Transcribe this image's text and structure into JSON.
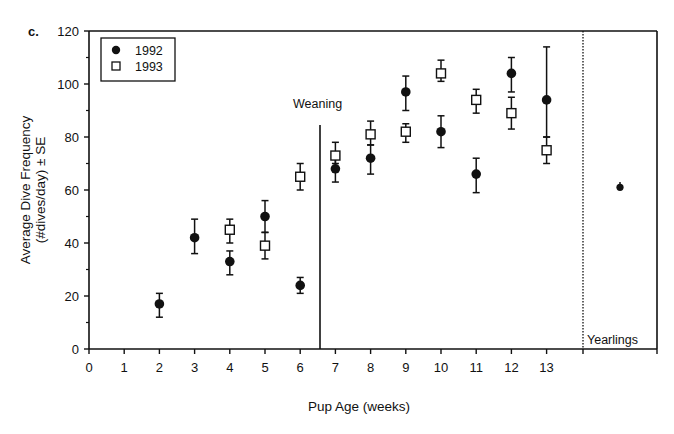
{
  "panel_label": "c.",
  "chart_data": {
    "type": "scatter",
    "title": "",
    "xlabel": "Pup Age (weeks)",
    "ylabel_line1": "Average Dive Frequency",
    "ylabel_line2": "(#dives/day) ± SE",
    "ylim": [
      0,
      120
    ],
    "xlim": [
      0,
      15
    ],
    "yticks": [
      0,
      20,
      40,
      60,
      80,
      100,
      120
    ],
    "xticks": [
      0,
      1,
      2,
      3,
      4,
      5,
      6,
      7,
      8,
      9,
      10,
      11,
      12,
      13
    ],
    "grid": false,
    "legend_position": "top-left",
    "annotations": [
      {
        "text": "Weaning",
        "x": 6.5,
        "type": "vertical-solid-line"
      },
      {
        "text": "Yearlings",
        "x": 14,
        "type": "vertical-dotted-line"
      }
    ],
    "series": [
      {
        "name": "1992",
        "marker": "filled-circle",
        "points": [
          {
            "x": 2,
            "y": 17,
            "lo": 12,
            "hi": 21
          },
          {
            "x": 3,
            "y": 42,
            "lo": 36,
            "hi": 49
          },
          {
            "x": 4,
            "y": 33,
            "lo": 28,
            "hi": 37
          },
          {
            "x": 5,
            "y": 50,
            "lo": 44,
            "hi": 56
          },
          {
            "x": 6,
            "y": 24,
            "lo": 21,
            "hi": 27
          },
          {
            "x": 7,
            "y": 68,
            "lo": 63,
            "hi": 73
          },
          {
            "x": 8,
            "y": 72,
            "lo": 66,
            "hi": 77
          },
          {
            "x": 9,
            "y": 97,
            "lo": 90,
            "hi": 103
          },
          {
            "x": 10,
            "y": 82,
            "lo": 76,
            "hi": 88
          },
          {
            "x": 11,
            "y": 66,
            "lo": 59,
            "hi": 72
          },
          {
            "x": 12,
            "y": 104,
            "lo": 97,
            "hi": 110
          },
          {
            "x": 13,
            "y": 94,
            "lo": 80,
            "hi": 114
          }
        ]
      },
      {
        "name": "1993",
        "marker": "open-square",
        "points": [
          {
            "x": 4,
            "y": 45,
            "lo": 40,
            "hi": 49
          },
          {
            "x": 5,
            "y": 39,
            "lo": 34,
            "hi": 44
          },
          {
            "x": 6,
            "y": 65,
            "lo": 60,
            "hi": 70
          },
          {
            "x": 7,
            "y": 73,
            "lo": 70,
            "hi": 78
          },
          {
            "x": 8,
            "y": 81,
            "lo": 77,
            "hi": 86
          },
          {
            "x": 9,
            "y": 82,
            "lo": 78,
            "hi": 85
          },
          {
            "x": 10,
            "y": 104,
            "lo": 101,
            "hi": 109
          },
          {
            "x": 11,
            "y": 94,
            "lo": 89,
            "hi": 98
          },
          {
            "x": 12,
            "y": 89,
            "lo": 83,
            "hi": 95
          },
          {
            "x": 13,
            "y": 75,
            "lo": 70,
            "hi": 80
          }
        ]
      },
      {
        "name": "Yearlings",
        "marker": "filled-circle",
        "points": [
          {
            "x": "Yearlings",
            "y": 61,
            "lo": 60,
            "hi": 63
          }
        ]
      }
    ]
  }
}
